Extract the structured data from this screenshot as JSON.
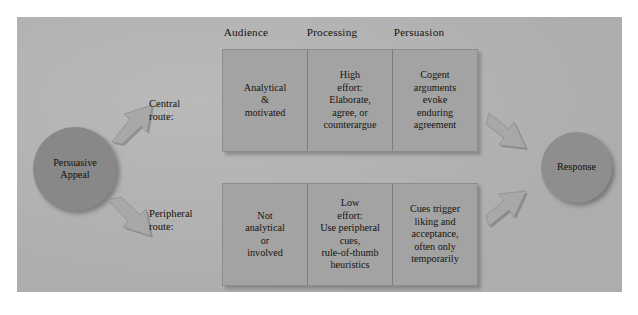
{
  "figure": {
    "caption": ""
  },
  "column_headers": [
    {
      "id": "audience",
      "label": "Audience"
    },
    {
      "id": "processing",
      "label": "Processing"
    },
    {
      "id": "persuasion",
      "label": "Persuasion"
    }
  ],
  "source_node": {
    "label": "Persuasive\nAppeal",
    "shape": "circle",
    "color": "#888888"
  },
  "target_node": {
    "label": "Response",
    "shape": "circle",
    "color": "#8e8e8e"
  },
  "routes": [
    {
      "id": "central",
      "label": "Central\nroute:",
      "cells": [
        {
          "column": "audience",
          "text": "Analytical\n&\nmotivated"
        },
        {
          "column": "processing",
          "text": "High\neffort:\nElaborate,\nagree, or\ncounterargue"
        },
        {
          "column": "persuasion",
          "text": "Cogent\narguments\nevoke\nenduring\nagreement"
        }
      ]
    },
    {
      "id": "peripheral",
      "label": "Peripheral\nroute:",
      "cells": [
        {
          "column": "audience",
          "text": "Not\nanalytical\nor\ninvolved"
        },
        {
          "column": "processing",
          "text": "Low\neffort:\nUse peripheral\ncues,\nrule-of-thumb\nheuristics"
        },
        {
          "column": "persuasion",
          "text": "Cues trigger\nliking and\nacceptance,\noften only\ntemporarily"
        }
      ]
    }
  ],
  "arrows": [
    {
      "id": "appeal-to-central",
      "from": "Persuasive Appeal",
      "to": "Central route",
      "direction": "up-right"
    },
    {
      "id": "appeal-to-peripheral",
      "from": "Persuasive Appeal",
      "to": "Peripheral route",
      "direction": "down-right"
    },
    {
      "id": "central-to-response",
      "from": "Central persuasion",
      "to": "Response",
      "direction": "down-right"
    },
    {
      "id": "peripheral-to-response",
      "from": "Peripheral persuasion",
      "to": "Response",
      "direction": "up-right"
    }
  ],
  "colors": {
    "panel_background": "#b4b4b4",
    "box_fill": "#a3a3a3",
    "box_border": "#8c8c8c",
    "divider": "#7d7d7d",
    "arrow_fill": "#a8a8a8",
    "text": "#14120f"
  }
}
